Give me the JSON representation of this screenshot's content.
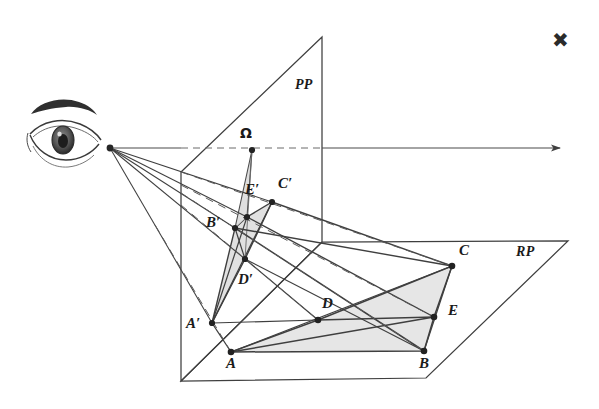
{
  "figure": {
    "type": "geometry-diagram",
    "topic": "perspective projection of a polygon from an eye point onto a picture plane",
    "background_color": "#ffffff",
    "stroke_color": "#3a3a3a",
    "fill_color": "#e2e2e2",
    "marker": {
      "glyph": "✖",
      "name": "x-mark",
      "x": 556,
      "y": 32
    },
    "planes": [
      {
        "id": "PP",
        "label": "PP",
        "label_x": 295,
        "label_y": 78,
        "outline": "181,172 322,37 322,242 322,242 181,381",
        "note": "picture plane, vertical, drawn as a quadrilateral"
      },
      {
        "id": "RP",
        "label": "RP",
        "label_x": 516,
        "label_y": 245,
        "outline": "322,242 568,241 426,378 181,381",
        "note": "reference / ground plane, horizontal, drawn in oblique view"
      }
    ],
    "sight_line": {
      "name": "line-of-sight",
      "from_x": 110,
      "from_y": 148,
      "to_x": 566,
      "to_y": 148,
      "arrow": true,
      "dash_segment": [
        181,
        148,
        322,
        148
      ]
    },
    "eye": {
      "name": "eye-drawing",
      "center_x": 64,
      "center_y": 134,
      "vertex_x": 110,
      "vertex_y": 148
    },
    "points": [
      {
        "id": "Omega",
        "label": "Ω",
        "x": 252,
        "y": 150,
        "lx": 240,
        "ly": 126,
        "plane": "PP"
      },
      {
        "id": "Ap",
        "label": "A′",
        "x": 212,
        "y": 323,
        "lx": 186,
        "ly": 323,
        "plane": "PP"
      },
      {
        "id": "Bp",
        "label": "B′",
        "x": 235,
        "y": 228,
        "lx": 206,
        "ly": 222,
        "plane": "PP"
      },
      {
        "id": "Cp",
        "label": "C′",
        "x": 272,
        "y": 202,
        "lx": 278,
        "ly": 180,
        "plane": "PP"
      },
      {
        "id": "Dp",
        "label": "D′",
        "x": 245,
        "y": 259,
        "lx": 238,
        "ly": 279,
        "plane": "PP"
      },
      {
        "id": "Ep",
        "label": "E′",
        "x": 247,
        "y": 217,
        "lx": 245,
        "ly": 186,
        "plane": "PP"
      },
      {
        "id": "A",
        "label": "A",
        "x": 231,
        "y": 352,
        "lx": 225,
        "ly": 361,
        "plane": "RP"
      },
      {
        "id": "B",
        "label": "B",
        "x": 424,
        "y": 351,
        "lx": 419,
        "ly": 360,
        "plane": "RP"
      },
      {
        "id": "C",
        "label": "C",
        "x": 452,
        "y": 266,
        "lx": 458,
        "ly": 245,
        "plane": "RP"
      },
      {
        "id": "D",
        "label": "D",
        "x": 318,
        "y": 320,
        "lx": 322,
        "ly": 298,
        "plane": "RP"
      },
      {
        "id": "E",
        "label": "E",
        "x": 434,
        "y": 317,
        "lx": 448,
        "ly": 308,
        "plane": "RP"
      }
    ],
    "projection_rays": [
      {
        "name": "ray-to-A",
        "eye_x": 110,
        "eye_y": 148,
        "pp_x": 212,
        "pp_y": 323,
        "rp_x": 231,
        "rp_y": 352
      },
      {
        "name": "ray-to-B",
        "eye_x": 110,
        "eye_y": 148,
        "pp_x": 235,
        "pp_y": 228,
        "rp_x": 424,
        "rp_y": 351
      },
      {
        "name": "ray-to-C",
        "eye_x": 110,
        "eye_y": 148,
        "pp_x": 272,
        "pp_y": 202,
        "rp_x": 452,
        "rp_y": 266
      },
      {
        "name": "ray-to-D",
        "eye_x": 110,
        "eye_y": 148,
        "pp_x": 245,
        "pp_y": 259,
        "rp_x": 318,
        "rp_y": 320
      },
      {
        "name": "ray-to-E",
        "eye_x": 110,
        "eye_y": 148,
        "pp_x": 247,
        "pp_y": 217,
        "rp_x": 434,
        "rp_y": 317
      }
    ],
    "object_polygon": {
      "name": "polygon-ABCE-on-RP",
      "vertices": [
        "A",
        "B",
        "E",
        "C",
        "D"
      ],
      "outline": "231,352 424,351 434,317 452,266 318,320",
      "shaded": true
    },
    "image_polygon": {
      "name": "polygon-image-on-PP",
      "vertices": [
        "Ap",
        "Bp",
        "Ep",
        "Cp",
        "Dp"
      ],
      "outline": "212,323 235,228 247,217 272,202 245,259",
      "shaded": true
    },
    "omega_triangle": {
      "name": "omega-cone",
      "outline": "252,150 235,228 247,217"
    }
  }
}
